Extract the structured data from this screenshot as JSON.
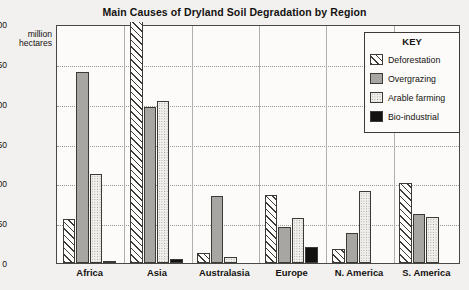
{
  "chart_data": {
    "type": "bar",
    "title": "Main Causes of Dryland Soil Degradation by Region",
    "xlabel": "",
    "ylabel": "million hectares",
    "ylim": [
      0,
      300
    ],
    "yticks": [
      0,
      50,
      100,
      150,
      200,
      250,
      300
    ],
    "grid": true,
    "legend_position": "top-right inside plot",
    "legend_title": "KEY",
    "categories": [
      "Africa",
      "Asia",
      "Australasia",
      "Europe",
      "N. America",
      "S. America"
    ],
    "series": [
      {
        "name": "Deforestation",
        "pattern": "diagonal-hatch",
        "values": [
          55,
          300,
          12,
          85,
          18,
          100
        ]
      },
      {
        "name": "Overgrazing",
        "pattern": "solid-gray",
        "values": [
          240,
          196,
          84,
          45,
          38,
          62
        ]
      },
      {
        "name": "Arable farming",
        "pattern": "light-dots",
        "values": [
          112,
          203,
          7,
          57,
          90,
          58
        ]
      },
      {
        "name": "Bio-industrial",
        "pattern": "solid-black",
        "values": [
          2,
          5,
          0,
          20,
          0,
          0
        ]
      }
    ]
  },
  "axis": {
    "unit_line_1": "million",
    "unit_line_2": "hectares",
    "tick_300": "300",
    "tick_250": "250",
    "tick_200": "200",
    "tick_150": "150",
    "tick_100": "100",
    "tick_50": "50",
    "tick_0": "0"
  }
}
